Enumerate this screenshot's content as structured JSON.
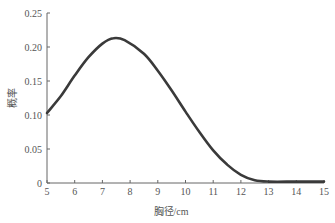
{
  "chart_data": {
    "type": "line",
    "title": "",
    "xlabel": "胸径/cm",
    "ylabel": "概率",
    "xlim": [
      5,
      15
    ],
    "ylim": [
      0,
      0.25
    ],
    "grid": false,
    "legend": null,
    "x_ticks": [
      "5",
      "6",
      "7",
      "8",
      "9",
      "10",
      "11",
      "12",
      "13",
      "14",
      "15"
    ],
    "y_ticks": [
      "0",
      "0.05",
      "0.10",
      "0.15",
      "0.20",
      "0.25"
    ],
    "series": [
      {
        "name": "probability",
        "color": "#3a3a3a",
        "x": [
          5,
          5.5,
          6,
          6.5,
          7,
          7.4,
          7.8,
          8.5,
          9,
          9.5,
          10,
          10.5,
          11,
          11.5,
          12,
          12.5,
          13,
          14,
          15
        ],
        "values": [
          0.103,
          0.128,
          0.158,
          0.185,
          0.205,
          0.213,
          0.21,
          0.19,
          0.165,
          0.136,
          0.105,
          0.075,
          0.048,
          0.027,
          0.012,
          0.004,
          0.002,
          0.002,
          0.002
        ]
      }
    ]
  }
}
